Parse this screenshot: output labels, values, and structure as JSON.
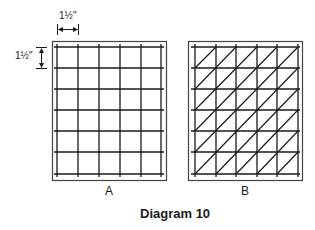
{
  "diagram": {
    "title": "Diagram 10",
    "panels": [
      {
        "label": "A",
        "type": "square-grid",
        "columns": 5,
        "rows": 6,
        "diagonals": false
      },
      {
        "label": "B",
        "type": "triangulated-grid",
        "columns": 5,
        "rows": 6,
        "diagonals": true,
        "diagonal_direction": "bottom-left-to-top-right"
      }
    ],
    "dimensions": {
      "horizontal_spacing": "1½\"",
      "vertical_spacing": "1½\""
    },
    "colors": {
      "line": "#1a1a1a",
      "frame": "#444444",
      "background": "#ffffff"
    }
  }
}
